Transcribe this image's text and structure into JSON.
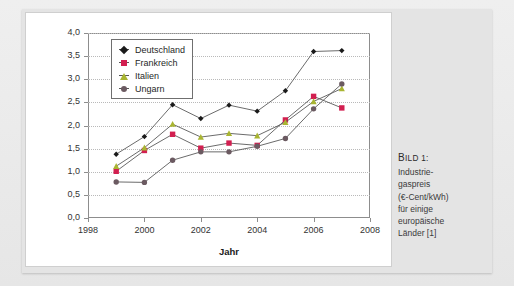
{
  "caption": {
    "head_big": "B",
    "head_rest": "ILD 1:",
    "lines": [
      "Industrie-",
      "gaspreis",
      "(€-Cent/kWh)",
      "für einige",
      "europäische",
      "Länder [1]"
    ]
  },
  "colors": {
    "deutschland": "#1a1a1a",
    "frankreich": "#d21f50",
    "italien": "#a9b531",
    "ungarn": "#6b5a61",
    "grid": "#b9b9b9",
    "axis": "#8d8d8d",
    "panel": "#ffffff",
    "page": "#e4e4e4"
  },
  "chart_data": {
    "type": "line",
    "title": "",
    "xlabel": "Jahr",
    "ylabel": "",
    "xlim": [
      1998,
      2008
    ],
    "ylim": [
      0.0,
      4.0
    ],
    "grid": true,
    "legend_position": "top-left",
    "x": [
      1999,
      2000,
      2001,
      2002,
      2003,
      2004,
      2005,
      2006,
      2007
    ],
    "xticks": [
      "1998",
      "2000",
      "2002",
      "2004",
      "2006",
      "2008"
    ],
    "xtick_values": [
      1998,
      2000,
      2002,
      2004,
      2006,
      2008
    ],
    "yticks": [
      "0,0",
      "0,5",
      "1,0",
      "1,5",
      "2,0",
      "2,5",
      "3,0",
      "3,5",
      "4,0"
    ],
    "ytick_values": [
      0.0,
      0.5,
      1.0,
      1.5,
      2.0,
      2.5,
      3.0,
      3.5,
      4.0
    ],
    "series": [
      {
        "name": "Deutschland",
        "marker": "diamond",
        "color": "#1a1a1a",
        "values": [
          1.38,
          1.76,
          2.45,
          2.15,
          2.44,
          2.31,
          2.75,
          3.6,
          3.62
        ]
      },
      {
        "name": "Frankreich",
        "marker": "square",
        "color": "#d21f50",
        "values": [
          1.01,
          1.46,
          1.81,
          1.51,
          1.62,
          1.57,
          2.12,
          2.63,
          2.38
        ]
      },
      {
        "name": "Italien",
        "marker": "triangle",
        "color": "#a9b531",
        "values": [
          1.12,
          1.52,
          2.03,
          1.75,
          1.83,
          1.78,
          2.07,
          2.52,
          2.8
        ]
      },
      {
        "name": "Ungarn",
        "marker": "circle",
        "color": "#6b5a61",
        "values": [
          0.78,
          0.77,
          1.25,
          1.43,
          1.43,
          1.55,
          1.72,
          2.36,
          2.9
        ]
      }
    ]
  }
}
